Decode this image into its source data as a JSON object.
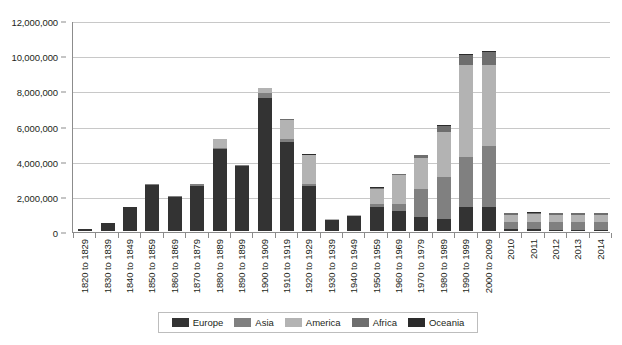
{
  "chart_data": {
    "type": "bar",
    "stacked": true,
    "title": "",
    "subtitle": "",
    "xlabel": "",
    "ylabel": "",
    "ylim": [
      0,
      12000000
    ],
    "ytick_step": 2000000,
    "ytick_labels": [
      "0",
      "2,000,000",
      "4,000,000",
      "6,000,000",
      "8,000,000",
      "10,000,000",
      "12,000,000"
    ],
    "ytick_values": [
      0,
      2000000,
      4000000,
      6000000,
      8000000,
      10000000,
      12000000
    ],
    "grid": true,
    "legend_position": "bottom",
    "categories": [
      "1820 to 1829",
      "1830 to 1839",
      "1840 to 1849",
      "1850 to 1859",
      "1860 to 1869",
      "1870 to 1879",
      "1880 to 1889",
      "1890 to 1899",
      "1900 to 1909",
      "1910 to 1919",
      "1920 to 1929",
      "1930 to 1939",
      "1940 to 1949",
      "1950 to 1959",
      "1960 to 1969",
      "1970 to 1979",
      "1980 to 1989",
      "1990 to 1999",
      "2000 to 2009",
      "2010",
      "2011",
      "2012",
      "2013",
      "2014"
    ],
    "series": [
      {
        "name": "Europe",
        "color": "#333333",
        "values": [
          100000,
          480000,
          1340000,
          2630000,
          1960000,
          2550000,
          4680000,
          3680000,
          7570000,
          5050000,
          2550000,
          620000,
          830000,
          1380000,
          1130000,
          800000,
          660000,
          1350000,
          1350000,
          95000,
          90000,
          86000,
          85000,
          85000
        ]
      },
      {
        "name": "Asia",
        "color": "#808080",
        "values": [
          0,
          0,
          0,
          30000,
          40000,
          120000,
          70000,
          60000,
          260000,
          200000,
          100000,
          20000,
          30000,
          150000,
          420000,
          1590000,
          2390000,
          2860000,
          3480000,
          420000,
          440000,
          430000,
          420000,
          420000
        ]
      },
      {
        "name": "America",
        "color": "#b3b3b3",
        "values": [
          0,
          0,
          0,
          0,
          0,
          0,
          500000,
          40000,
          280000,
          1090000,
          1680000,
          50000,
          30000,
          870000,
          1620000,
          1790000,
          2570000,
          5210000,
          4620000,
          400000,
          410000,
          400000,
          395000,
          400000
        ]
      },
      {
        "name": "Africa",
        "color": "#6e6e6e",
        "values": [
          0,
          0,
          0,
          0,
          0,
          0,
          0,
          0,
          30000,
          20000,
          20000,
          10000,
          10000,
          60000,
          80000,
          130000,
          380000,
          580000,
          710000,
          100000,
          100000,
          100000,
          100000,
          100000
        ]
      },
      {
        "name": "Oceania",
        "color": "#2b2b2b",
        "values": [
          0,
          0,
          0,
          0,
          0,
          0,
          0,
          0,
          10000,
          10000,
          10000,
          0,
          0,
          20000,
          20000,
          30000,
          40000,
          60000,
          70000,
          15000,
          15000,
          15000,
          15000,
          15000
        ]
      }
    ]
  }
}
